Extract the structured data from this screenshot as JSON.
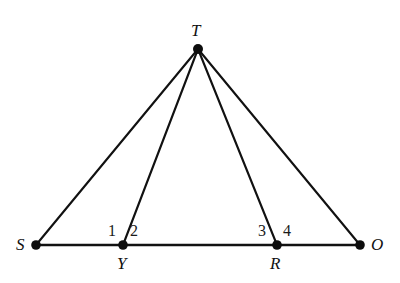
{
  "figure": {
    "background_color": "#ffffff",
    "stroke_color": "#111111",
    "dot_color": "#0d0d0d",
    "width": 400,
    "height": 283
  },
  "points": [
    {
      "id": "T",
      "label": "T",
      "x": 198,
      "y": 49,
      "label_x": 191,
      "label_y": 22,
      "dot_r": 5.0
    },
    {
      "id": "S",
      "label": "S",
      "x": 36,
      "y": 245,
      "label_x": 16,
      "label_y": 236,
      "dot_r": 4.8
    },
    {
      "id": "Y",
      "label": "Y",
      "x": 123,
      "y": 245,
      "label_x": 117,
      "label_y": 255,
      "dot_r": 4.8
    },
    {
      "id": "R",
      "label": "R",
      "x": 277,
      "y": 245,
      "label_x": 270,
      "label_y": 255,
      "dot_r": 4.8
    },
    {
      "id": "O",
      "label": "O",
      "x": 360,
      "y": 245,
      "label_x": 371,
      "label_y": 236,
      "dot_r": 4.8
    }
  ],
  "segments": [
    {
      "id": "TS",
      "from": "T",
      "to": "S",
      "x1": 198,
      "y1": 49,
      "x2": 36,
      "y2": 245
    },
    {
      "id": "TY",
      "from": "T",
      "to": "Y",
      "x1": 198,
      "y1": 49,
      "x2": 123,
      "y2": 245
    },
    {
      "id": "TR",
      "from": "T",
      "to": "R",
      "x1": 198,
      "y1": 49,
      "x2": 277,
      "y2": 245
    },
    {
      "id": "TO",
      "from": "T",
      "to": "O",
      "x1": 198,
      "y1": 49,
      "x2": 360,
      "y2": 245
    },
    {
      "id": "SO",
      "from": "S",
      "to": "O",
      "x1": 36,
      "y1": 245,
      "x2": 360,
      "y2": 245
    }
  ],
  "angle_labels": [
    {
      "id": "a1",
      "text": "1",
      "x": 108,
      "y": 223,
      "at_vertex": "Y",
      "side": "left"
    },
    {
      "id": "a2",
      "text": "2",
      "x": 130,
      "y": 223,
      "at_vertex": "Y",
      "side": "right"
    },
    {
      "id": "a3",
      "text": "3",
      "x": 258,
      "y": 223,
      "at_vertex": "R",
      "side": "left"
    },
    {
      "id": "a4",
      "text": "4",
      "x": 283,
      "y": 223,
      "at_vertex": "R",
      "side": "right"
    }
  ]
}
